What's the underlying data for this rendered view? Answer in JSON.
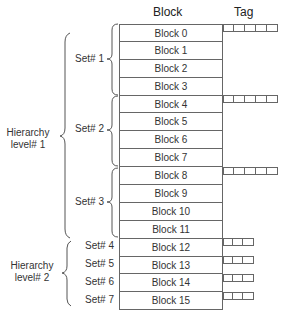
{
  "headers": {
    "block": "Block",
    "tag": "Tag"
  },
  "blocks": [
    "Block 0",
    "Block 1",
    "Block 2",
    "Block 3",
    "Block 4",
    "Block 5",
    "Block 6",
    "Block 7",
    "Block 8",
    "Block 9",
    "Block 10",
    "Block 11",
    "Block 12",
    "Block 13",
    "Block 14",
    "Block 15"
  ],
  "sets": {
    "s1": "Set# 1",
    "s2": "Set# 2",
    "s3": "Set# 3",
    "s4": "Set# 4",
    "s5": "Set# 5",
    "s6": "Set# 6",
    "s7": "Set# 7"
  },
  "hierarchy": {
    "l1a": "Hierarchy",
    "l1b": "level# 1",
    "l2a": "Hierarchy",
    "l2b": "level# 2"
  }
}
